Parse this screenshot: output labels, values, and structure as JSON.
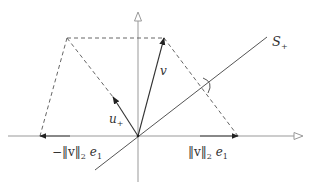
{
  "diagram": {
    "type": "vector-reflection",
    "colors": {
      "axis": "#999999",
      "line": "#555555",
      "vector": "#333333",
      "dashed": "#666666",
      "background": "#ffffff"
    },
    "labels": {
      "subspace": {
        "base": "S",
        "sub": "+"
      },
      "v": {
        "text": "v"
      },
      "u_plus": {
        "base": "u",
        "sub": "+"
      },
      "pos_e1": {
        "norm": "‖v‖",
        "sub": "2",
        "basis": "e",
        "basis_sub": "1"
      },
      "neg_e1": {
        "prefix": "−",
        "norm": "‖v‖",
        "sub": "2",
        "basis": "e",
        "basis_sub": "1"
      }
    },
    "points": {
      "origin": [
        138,
        136
      ],
      "v_tip": [
        164,
        38
      ],
      "reflected_top": [
        67,
        38
      ],
      "u_plus_tip": [
        113,
        97
      ],
      "pos_e1_tip": [
        238,
        136
      ],
      "neg_e1_tip": [
        40,
        136
      ]
    },
    "icons": {
      "vertical-axis-arrow": "open-triangle-up",
      "horizontal-axis-arrow": "open-triangle-right",
      "angle-marker": "arc"
    }
  }
}
